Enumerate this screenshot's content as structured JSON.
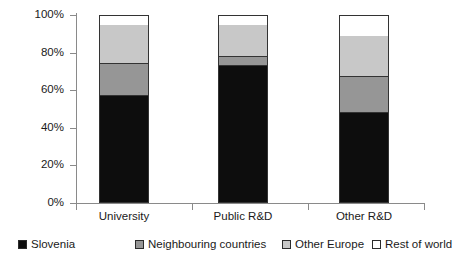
{
  "chart_data": {
    "type": "bar",
    "subtype": "stacked-100-percent",
    "title": "",
    "xlabel": "",
    "ylabel": "",
    "categories": [
      "University",
      "Public R&D",
      "Other R&D"
    ],
    "series": [
      {
        "name": "Slovenia",
        "color": "#0d0d0d",
        "values": [
          57,
          73,
          48
        ]
      },
      {
        "name": "Neighbouring countries",
        "color": "#969696",
        "values": [
          17,
          5,
          19
        ]
      },
      {
        "name": "Other Europe",
        "color": "#c8c8c8",
        "values": [
          21,
          17,
          22
        ]
      },
      {
        "name": "Rest of world",
        "color": "#ffffff",
        "values": [
          5,
          5,
          11
        ]
      }
    ],
    "ylim": [
      0,
      100
    ],
    "ytick_labels": [
      "0%",
      "20%",
      "40%",
      "60%",
      "80%",
      "100%"
    ],
    "ytick_values": [
      0,
      20,
      40,
      60,
      80,
      100
    ],
    "grid": false,
    "legend_position": "bottom",
    "legend_entries": [
      {
        "label": "Slovenia",
        "color": "#0d0d0d"
      },
      {
        "label": "Neighbouring countries",
        "color": "#969696"
      },
      {
        "label": "Other Europe",
        "color": "#c8c8c8"
      },
      {
        "label": "Rest of world",
        "color": "#ffffff"
      }
    ]
  },
  "colors": {
    "slovenia": "#0d0d0d",
    "neighbouring": "#969696",
    "other_europe": "#c8c8c8",
    "rest_of_world": "#ffffff",
    "axis": "#8a8a8a",
    "outline": "#333333",
    "text": "#1a1a1a",
    "background": "#ffffff"
  }
}
